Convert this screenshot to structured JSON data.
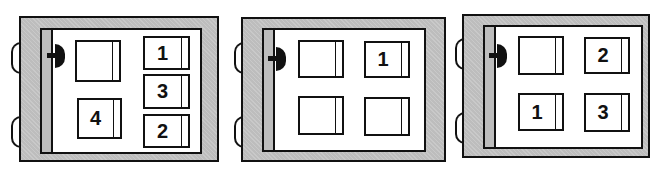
{
  "panels": [
    {
      "id": 1,
      "cards": [
        {
          "label": ""
        },
        {
          "label": "1"
        },
        {
          "label": "3"
        },
        {
          "label": "4"
        },
        {
          "label": "2"
        }
      ]
    },
    {
      "id": 2,
      "cards": [
        {
          "label": ""
        },
        {
          "label": "1"
        },
        {
          "label": ""
        },
        {
          "label": ""
        }
      ]
    },
    {
      "id": 3,
      "cards": [
        {
          "label": ""
        },
        {
          "label": "2"
        },
        {
          "label": "1"
        },
        {
          "label": "3"
        }
      ]
    }
  ],
  "colors": {
    "frame": "#bdbdbd",
    "stroke": "#111111",
    "page": "#ffffff"
  }
}
